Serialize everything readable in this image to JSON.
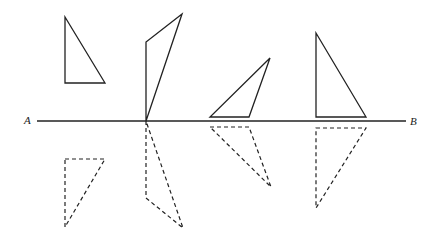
{
  "diagram": {
    "line": {
      "start_label": "A",
      "end_label": "B",
      "x1": 37,
      "y1": 121,
      "x2": 406,
      "y2": 121,
      "label_a_pos": [
        24,
        115
      ],
      "label_b_pos": [
        410,
        116
      ]
    },
    "colors": {
      "stroke": "#222222",
      "background": "#ffffff"
    },
    "triangles": [
      {
        "id": "triangle-1",
        "original": "65,17 65,83 105,83",
        "reflection": "65,159 105,159 65,227"
      },
      {
        "id": "triangle-2",
        "original": "182,14 146,42 146,121",
        "reflection": "146,121 146,198 183,228"
      },
      {
        "id": "triangle-3",
        "original": "270,58 210,117 249,117",
        "reflection": "210,127 249,127 271,187"
      },
      {
        "id": "triangle-4",
        "original": "316,33 316,117 366,117",
        "reflection": "316,128 366,128 316,208"
      }
    ]
  }
}
